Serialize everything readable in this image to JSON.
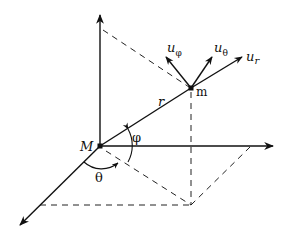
{
  "diagram": {
    "type": "spherical-coordinates",
    "labels": {
      "origin": "M",
      "point": "m",
      "radius": "r",
      "polar_angle": "φ",
      "azimuth_angle": "θ",
      "unit_r": "u",
      "unit_r_sub": "r",
      "unit_theta": "u",
      "unit_theta_sub": "θ",
      "unit_phi": "u",
      "unit_phi_sub": "φ"
    },
    "colors": {
      "stroke": "#111111",
      "background": "#ffffff"
    }
  }
}
